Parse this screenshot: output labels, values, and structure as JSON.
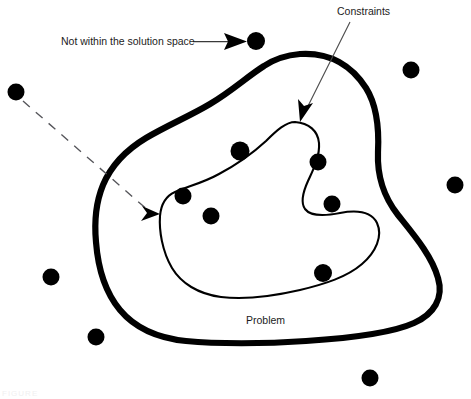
{
  "figure": {
    "background_color": "#ffffff",
    "ink_color": "#000000",
    "width": 471,
    "height": 399,
    "bottom_caption_fragment": "FIGURE"
  },
  "labels": {
    "not_within": "Not within the solution space",
    "constraints": "Constraints",
    "problem": "Problem"
  },
  "regions": [
    {
      "name": "solution-space",
      "style": "thick outline closed blob",
      "stroke_width": 6.2,
      "stroke_color": "#000000",
      "label": "Constraints"
    },
    {
      "name": "problem-space",
      "style": "thin outline closed blob nested inside solution space",
      "stroke_width": 2.1,
      "stroke_color": "#000000",
      "label": "Problem"
    }
  ],
  "dots": [
    {
      "id": "dot-outside-top",
      "cx": 256,
      "cy": 41,
      "r": 9,
      "inside": "outside",
      "annotated": true
    },
    {
      "id": "dot-outside-left-upper",
      "cx": 16,
      "cy": 92,
      "r": 8.5,
      "inside": "outside",
      "annotated": false
    },
    {
      "id": "dot-outside-right-upper",
      "cx": 411,
      "cy": 70,
      "r": 8.5,
      "inside": "outside",
      "annotated": false
    },
    {
      "id": "dot-outside-right-mid",
      "cx": 455,
      "cy": 185,
      "r": 8.5,
      "inside": "outside",
      "annotated": false
    },
    {
      "id": "dot-outside-left-lower",
      "cx": 51,
      "cy": 277,
      "r": 8.5,
      "inside": "outside",
      "annotated": false
    },
    {
      "id": "dot-outside-bottom-left",
      "cx": 96,
      "cy": 337,
      "r": 8.5,
      "inside": "outside",
      "annotated": false
    },
    {
      "id": "dot-outside-bottom-right",
      "cx": 370,
      "cy": 378,
      "r": 8.5,
      "inside": "outside",
      "annotated": false
    },
    {
      "id": "dot-boundary-top",
      "cx": 240,
      "cy": 151,
      "r": 9.5,
      "inside": "problem-border",
      "annotated": false
    },
    {
      "id": "dot-boundary-left",
      "cx": 183,
      "cy": 196,
      "r": 8.5,
      "inside": "problem-border",
      "annotated": false
    },
    {
      "id": "dot-inner-left",
      "cx": 211,
      "cy": 216,
      "r": 8.5,
      "inside": "problem",
      "annotated": false
    },
    {
      "id": "dot-inner-upper-right",
      "cx": 318,
      "cy": 162,
      "r": 8.5,
      "inside": "solution",
      "annotated": false
    },
    {
      "id": "dot-inner-right",
      "cx": 332,
      "cy": 204,
      "r": 8.5,
      "inside": "problem-border",
      "annotated": false
    },
    {
      "id": "dot-inner-bottom",
      "cx": 323,
      "cy": 273,
      "r": 9,
      "inside": "problem",
      "annotated": false
    }
  ],
  "connectors": [
    {
      "id": "not-within-leader",
      "type": "solid-arrow",
      "from": [
        193,
        41
      ],
      "to": [
        243,
        41
      ],
      "label": "Not within the solution space"
    },
    {
      "id": "constraints-leader",
      "type": "solid-arrow",
      "from": [
        350,
        22
      ],
      "to": [
        302,
        118
      ],
      "label": "Constraints"
    },
    {
      "id": "dashed-solution-pointer",
      "type": "dashed-arrow",
      "from": [
        22,
        101
      ],
      "to": [
        157,
        213
      ],
      "label": ""
    }
  ]
}
